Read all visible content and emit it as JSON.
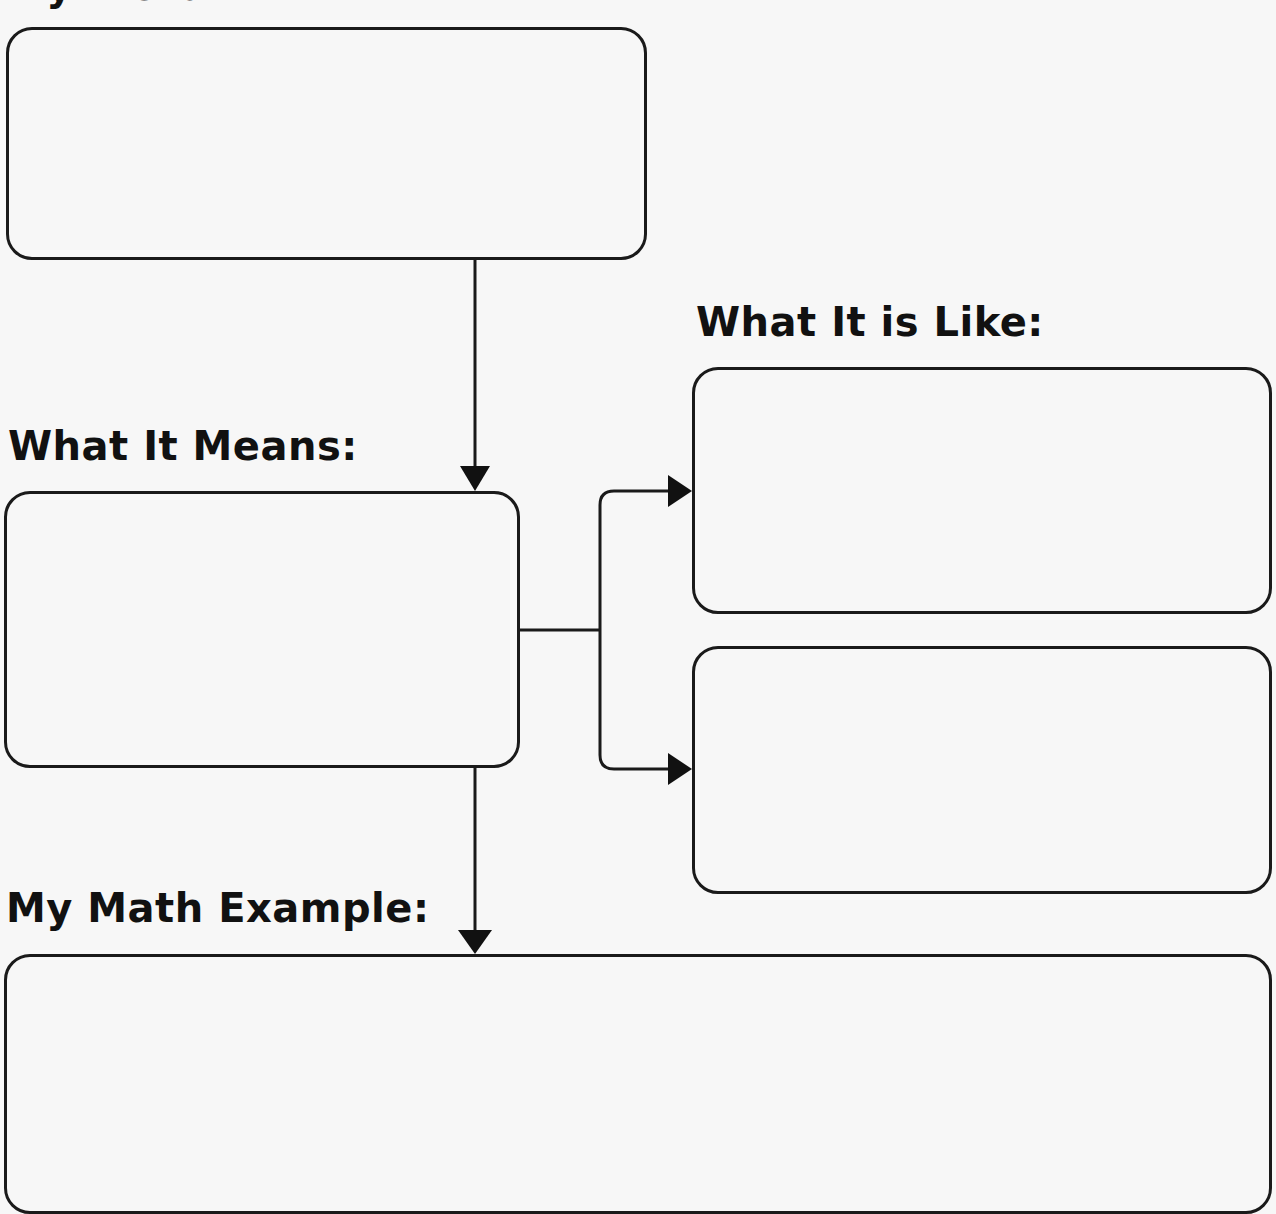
{
  "top_heading": {
    "label": "My Word:"
  },
  "headings": {
    "means": "What It Means:",
    "like": "What It is Like:",
    "example": "My Math Example:"
  },
  "boxes": [
    {
      "id": "word-box",
      "content": ""
    },
    {
      "id": "means-box",
      "content": ""
    },
    {
      "id": "like-box-1",
      "content": ""
    },
    {
      "id": "like-box-2",
      "content": ""
    },
    {
      "id": "example-box",
      "content": ""
    }
  ],
  "colors": {
    "line": "#1a1a1a",
    "background": "#f7f7f7"
  }
}
